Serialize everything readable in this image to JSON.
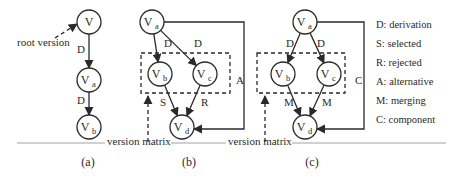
{
  "figure": {
    "baseline": {
      "y": 143,
      "segments": [
        [
          17,
          105
        ],
        [
          171,
          226
        ],
        [
          292,
          446
        ]
      ]
    },
    "version_matrix_labels": [
      {
        "text": "version matrix",
        "x": 107,
        "y": 145
      },
      {
        "text": "version matrix",
        "x": 228,
        "y": 145
      }
    ],
    "captions": [
      {
        "text": "(a)",
        "x": 88,
        "y": 166
      },
      {
        "text": "(b)",
        "x": 189,
        "y": 166
      },
      {
        "text": "(c)",
        "x": 312,
        "y": 166
      }
    ]
  },
  "panels": {
    "a": {
      "caption": "(a)",
      "root_label": {
        "text": "root version",
        "x": 17,
        "y": 46
      },
      "nodes": [
        {
          "id": "V",
          "main": "V",
          "sub": "",
          "cx": 89,
          "cy": 22
        },
        {
          "id": "Va",
          "main": "V",
          "sub": "a",
          "cx": 89,
          "cy": 80
        },
        {
          "id": "Vb",
          "main": "V",
          "sub": "b",
          "cx": 89,
          "cy": 127
        }
      ],
      "edges": [
        {
          "from": "V",
          "to": "Va",
          "label": "D",
          "lx": 77,
          "ly": 53
        },
        {
          "from": "Va",
          "to": "Vb",
          "label": "D",
          "lx": 77,
          "ly": 104
        }
      ]
    },
    "b": {
      "caption": "(b)",
      "nodes": [
        {
          "id": "Va",
          "main": "V",
          "sub": "a",
          "cx": 152,
          "cy": 22
        },
        {
          "id": "Vb",
          "main": "V",
          "sub": "b",
          "cx": 160,
          "cy": 74
        },
        {
          "id": "Vc",
          "main": "V",
          "sub": "c",
          "cx": 205,
          "cy": 74
        },
        {
          "id": "Vd",
          "main": "V",
          "sub": "d",
          "cx": 182,
          "cy": 127
        }
      ],
      "edges": [
        {
          "from": "Va",
          "to": "Vb",
          "label": "D",
          "lx": 164,
          "ly": 47
        },
        {
          "from": "Va",
          "to": "Vc",
          "label": "D",
          "lx": 194,
          "ly": 47
        },
        {
          "from": "Vb",
          "to": "Vd",
          "label": "S",
          "lx": 160,
          "ly": 106
        },
        {
          "from": "Vc",
          "to": "Vd",
          "label": "R",
          "lx": 201,
          "ly": 106
        }
      ],
      "side_edge": {
        "label": "A",
        "line_x": 244,
        "lx": 236,
        "ly": 84
      },
      "box": {
        "x": 141,
        "y": 53,
        "w": 89,
        "h": 40
      },
      "matrix_arrow": {
        "x": 148,
        "y1": 142,
        "y2": 96
      }
    },
    "c": {
      "caption": "(c)",
      "nodes": [
        {
          "id": "Va",
          "main": "V",
          "sub": "a",
          "cx": 305,
          "cy": 22
        },
        {
          "id": "Vb",
          "main": "V",
          "sub": "b",
          "cx": 283,
          "cy": 74
        },
        {
          "id": "Vc",
          "main": "V",
          "sub": "c",
          "cx": 329,
          "cy": 74
        },
        {
          "id": "Vd",
          "main": "V",
          "sub": "d",
          "cx": 305,
          "cy": 127
        }
      ],
      "edges": [
        {
          "from": "Va",
          "to": "Vb",
          "label": "D",
          "lx": 286,
          "ly": 47
        },
        {
          "from": "Va",
          "to": "Vc",
          "label": "D",
          "lx": 317,
          "ly": 47
        },
        {
          "from": "Vb",
          "to": "Vd",
          "label": "M",
          "lx": 284,
          "ly": 106
        },
        {
          "from": "Vc",
          "to": "Vd",
          "label": "M",
          "lx": 322,
          "ly": 106
        }
      ],
      "side_edge": {
        "label": "C",
        "line_x": 364,
        "lx": 355,
        "ly": 84
      },
      "box": {
        "x": 257,
        "y": 53,
        "w": 88,
        "h": 40
      },
      "matrix_arrow": {
        "x": 265,
        "y1": 142,
        "y2": 96
      }
    }
  },
  "legend": {
    "x": 376,
    "y0": 28,
    "dy": 19,
    "items": [
      {
        "key": "D",
        "text": "D: derivation"
      },
      {
        "key": "S",
        "text": "S: selected"
      },
      {
        "key": "R",
        "text": "R: rejected"
      },
      {
        "key": "A",
        "text": "A: alternative"
      },
      {
        "key": "M",
        "text": "M: merging"
      },
      {
        "key": "C",
        "text": "C: component"
      }
    ]
  },
  "style": {
    "ink": "#2a2a2a",
    "baseline": "#8a8a8a",
    "node_radius": 12
  }
}
